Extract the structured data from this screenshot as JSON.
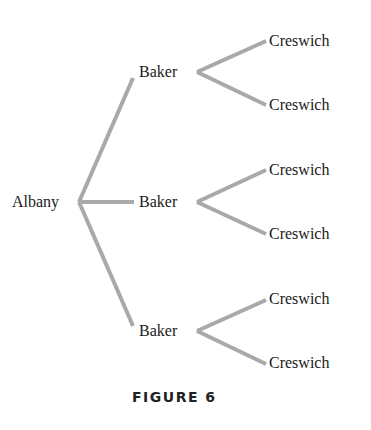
{
  "figure": {
    "caption": "FIGURE 6",
    "edge_color": "#a9a9a9",
    "root": {
      "label": "Albany",
      "children": [
        {
          "label": "Baker",
          "children": [
            {
              "label": "Creswich"
            },
            {
              "label": "Creswich"
            }
          ]
        },
        {
          "label": "Baker",
          "children": [
            {
              "label": "Creswich"
            },
            {
              "label": "Creswich"
            }
          ]
        },
        {
          "label": "Baker",
          "children": [
            {
              "label": "Creswich"
            },
            {
              "label": "Creswich"
            }
          ]
        }
      ]
    }
  }
}
